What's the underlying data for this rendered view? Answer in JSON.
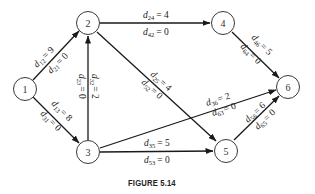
{
  "caption": "FIGURE 5.14",
  "nodes": [
    {
      "id": "1",
      "label": "1",
      "x": 25,
      "y": 89
    },
    {
      "id": "2",
      "label": "2",
      "x": 88,
      "y": 23
    },
    {
      "id": "3",
      "label": "3",
      "x": 88,
      "y": 152
    },
    {
      "id": "4",
      "label": "4",
      "x": 223,
      "y": 23
    },
    {
      "id": "5",
      "label": "5",
      "x": 226,
      "y": 150
    },
    {
      "id": "6",
      "label": "6",
      "x": 288,
      "y": 87
    }
  ],
  "edges": [
    {
      "from": "1",
      "to": "2",
      "label_a": {
        "var": "d",
        "sub": "12",
        "val": "= 9"
      },
      "label_b": {
        "var": "d",
        "sub": "21",
        "val": "= 0"
      }
    },
    {
      "from": "1",
      "to": "3",
      "label_a": {
        "var": "d",
        "sub": "13",
        "val": "= 8"
      },
      "label_b": {
        "var": "d",
        "sub": "31",
        "val": "= 0"
      }
    },
    {
      "from": "3",
      "to": "2",
      "label_a": {
        "var": "d",
        "sub": "23",
        "val": "= 0"
      },
      "label_b": {
        "var": "d",
        "sub": "32",
        "val": "= 2"
      }
    },
    {
      "from": "2",
      "to": "4",
      "label_a": {
        "var": "d",
        "sub": "24",
        "val": "= 4"
      },
      "label_b": {
        "var": "d",
        "sub": "42",
        "val": "= 0"
      }
    },
    {
      "from": "2",
      "to": "5",
      "label_a": {
        "var": "d",
        "sub": "25",
        "val": "= 4"
      },
      "label_b": {
        "var": "d",
        "sub": "52",
        "val": "= 0"
      }
    },
    {
      "from": "4",
      "to": "6",
      "label_a": {
        "var": "d",
        "sub": "46",
        "val": "= 5"
      },
      "label_b": {
        "var": "d",
        "sub": "64",
        "val": "= 0"
      }
    },
    {
      "from": "3",
      "to": "6",
      "label_a": {
        "var": "d",
        "sub": "36",
        "val": "= 2"
      },
      "label_b": {
        "var": "d",
        "sub": "63",
        "val": "= 0"
      }
    },
    {
      "from": "3",
      "to": "5",
      "label_a": {
        "var": "d",
        "sub": "35",
        "val": "= 5"
      },
      "label_b": {
        "var": "d",
        "sub": "53",
        "val": "= 0"
      }
    },
    {
      "from": "5",
      "to": "6",
      "label_a": {
        "var": "d",
        "sub": "56",
        "val": "= 6"
      },
      "label_b": {
        "var": "d",
        "sub": "65",
        "val": "= 0"
      }
    }
  ]
}
